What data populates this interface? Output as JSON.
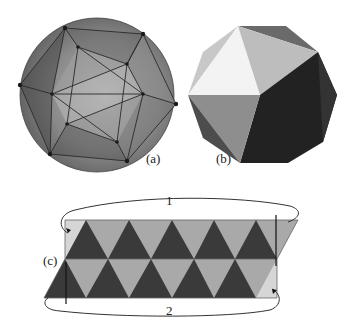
{
  "figure": {
    "panels": [
      {
        "id": "a",
        "label": "(a)",
        "description": "Icosahedron inscribed in a sphere (translucent view)"
      },
      {
        "id": "b",
        "label": "(b)",
        "description": "Solid shaded icosahedron"
      },
      {
        "id": "c",
        "label": "(c)",
        "description": "Unfolded triangular strip with edges 1 and 2 to be joined"
      }
    ],
    "strip": {
      "arrow_top_label": "1",
      "arrow_bottom_label": "2",
      "rows": 2,
      "dark_color": "#3a3a3a",
      "light_color": "#a9a9a9",
      "pale_color": "#d6d6d6"
    },
    "colors": {
      "sphere_outer": "#6e6e6e",
      "sphere_inner": "#9a9a9a",
      "ico_white": "#f2f2f2",
      "ico_light": "#c4c4c4",
      "ico_mid": "#8f8f8f",
      "ico_dark": "#1e1e1e",
      "ico_darker": "#2c2c2c"
    }
  }
}
